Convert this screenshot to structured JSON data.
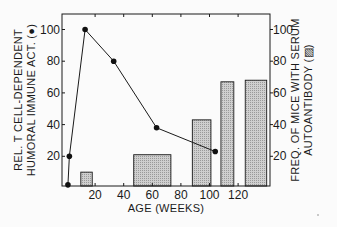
{
  "chart_data": {
    "type": "bar+line",
    "title": "",
    "xlabel": "AGE (WEEKS)",
    "ylabel_left": [
      "REL. T CELL-DEPENDENT",
      "HUMORAL IMMUNE ACT. (●)"
    ],
    "ylabel_right": [
      "FREQ. OF MICE WITH SERUM",
      "AUTOANTIBODY (▨)"
    ],
    "x_ticks": [
      20,
      40,
      60,
      80,
      100,
      120
    ],
    "y_ticks_left": [
      20,
      40,
      60,
      80,
      100
    ],
    "y_ticks_right": [
      20,
      40,
      60,
      80,
      100
    ],
    "xlim": [
      0,
      140
    ],
    "ylim_left": [
      0,
      110
    ],
    "ylim_right": [
      0,
      110
    ],
    "grid": false,
    "series": [
      {
        "name": "Relative T cell-dependent humoral immune activity",
        "kind": "line",
        "axis": "left",
        "marker": "filled-circle",
        "x": [
          1,
          2,
          13,
          33,
          63,
          104
        ],
        "y": [
          2,
          20,
          100,
          80,
          38,
          23
        ]
      },
      {
        "name": "Frequency of mice with serum autoantibody",
        "kind": "bar",
        "axis": "right",
        "bars": [
          {
            "x_start": 10,
            "x_end": 18,
            "value": 10
          },
          {
            "x_start": 47,
            "x_end": 73,
            "value": 21
          },
          {
            "x_start": 88,
            "x_end": 101,
            "value": 43
          },
          {
            "x_start": 108,
            "x_end": 117,
            "value": 67
          },
          {
            "x_start": 125,
            "x_end": 140,
            "value": 68
          }
        ]
      }
    ]
  }
}
